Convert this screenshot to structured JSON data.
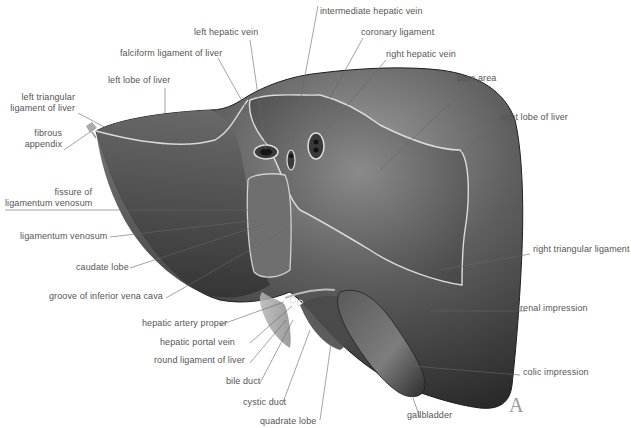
{
  "figure": {
    "panel_letter": "A",
    "labels": {
      "intermediate_hepatic_vein": "intermediate hepatic vein",
      "left_hepatic_vein": "left hepatic vein",
      "coronary_ligament": "coronary ligament",
      "falciform_ligament": "falciform ligament of liver",
      "right_hepatic_vein": "right hepatic vein",
      "bare_area": "bare area",
      "left_lobe": "left lobe of liver",
      "left_triangular_ligament": "left triangular\nligament of liver",
      "right_lobe": "right lobe of liver",
      "fibrous_appendix": "fibrous\nappendix",
      "fissure_ligamentum_venosum": "fissure of\nligamentum venosum",
      "ligamentum_venosum": "ligamentum venosum",
      "right_triangular_ligament": "right triangular ligament",
      "caudate_lobe": "caudate lobe",
      "groove_ivc": "groove of inferior vena cava",
      "renal_impression": "renal impression",
      "hepatic_artery_proper": "hepatic artery proper",
      "hepatic_portal_vein": "hepatic portal vein",
      "round_ligament": "round ligament of liver",
      "colic_impression": "colic impression",
      "bile_duct": "bile duct",
      "cystic_duct": "cystic duct",
      "gallbladder": "gallbladder",
      "quadrate_lobe": "quadrate lobe"
    }
  }
}
